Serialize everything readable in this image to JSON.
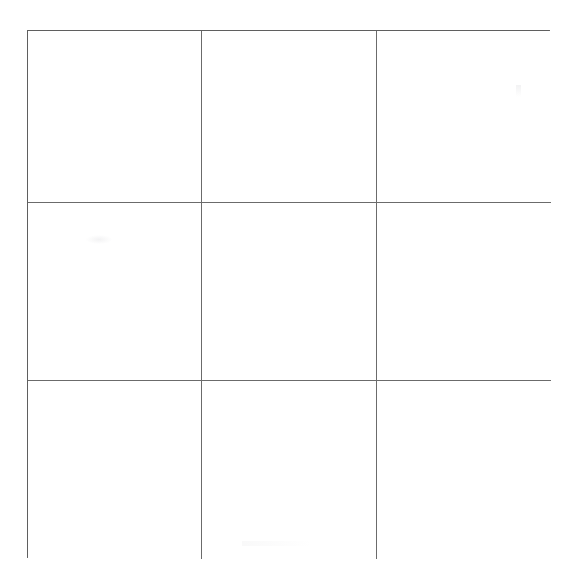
{
  "document": {
    "type": "blank-grid-worksheet",
    "background_color": "#ffffff",
    "canvas_width": 579,
    "canvas_height": 587
  },
  "grid": {
    "rows": 3,
    "columns": 3,
    "total_cells": 9,
    "line_color": "#6b6b6b",
    "border_color": "#5f5f5f",
    "line_width_px": 1,
    "bounds": {
      "left": 27,
      "top": 30,
      "right": 550,
      "bottom": 558,
      "width": 523,
      "height": 528
    },
    "vertical_rule_positions": [
      201,
      376
    ],
    "horizontal_rule_positions": [
      202,
      380
    ],
    "column_widths": [
      174,
      175,
      174
    ],
    "row_heights": [
      172,
      178,
      178
    ],
    "cells": [
      {
        "id": "cell-r1c1",
        "row": 1,
        "column": 1,
        "content": ""
      },
      {
        "id": "cell-r1c2",
        "row": 1,
        "column": 2,
        "content": ""
      },
      {
        "id": "cell-r1c3",
        "row": 1,
        "column": 3,
        "content": ""
      },
      {
        "id": "cell-r2c1",
        "row": 2,
        "column": 1,
        "content": ""
      },
      {
        "id": "cell-r2c2",
        "row": 2,
        "column": 2,
        "content": ""
      },
      {
        "id": "cell-r2c3",
        "row": 2,
        "column": 3,
        "content": ""
      },
      {
        "id": "cell-r3c1",
        "row": 3,
        "column": 1,
        "content": ""
      },
      {
        "id": "cell-r3c2",
        "row": 3,
        "column": 2,
        "content": ""
      },
      {
        "id": "cell-r3c3",
        "row": 3,
        "column": 3,
        "content": ""
      }
    ]
  },
  "artifacts": [
    {
      "id": "artifact-mid-left",
      "description": "faint smudge in middle-left cell"
    },
    {
      "id": "artifact-top-right",
      "description": "faint vertical speck in top-right cell"
    },
    {
      "id": "artifact-top-left-edge",
      "description": "faint horizontal streak above top border"
    },
    {
      "id": "artifact-bottom-center",
      "description": "faint horizontal streak near bottom border"
    }
  ]
}
